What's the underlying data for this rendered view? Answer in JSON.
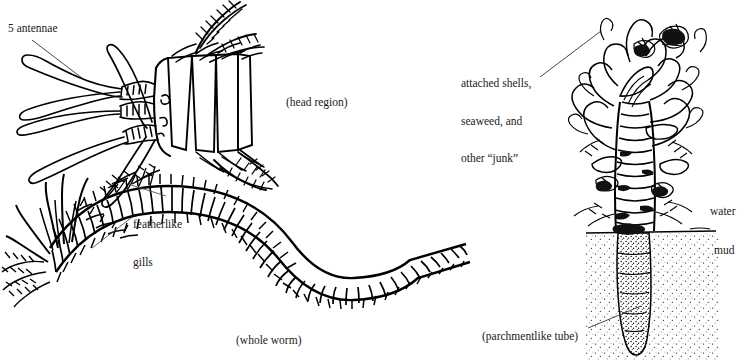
{
  "figure": {
    "background_color": "#ffffff",
    "ink_color": "#000000",
    "width": 744,
    "height": 360
  },
  "labels": {
    "antennae": "5 antennae",
    "gills_line1": "featherlike",
    "gills_line2": "gills",
    "junk_line1": "attached shells,",
    "junk_line2": "seaweed, and",
    "junk_line3": "other “junk”",
    "water": "water",
    "mud": "mud"
  },
  "captions": {
    "head_region": "(head region)",
    "whole_worm": "(whole worm)",
    "parchment_tube": "(parchmentlike tube)"
  },
  "icons": {
    "leader_antennae": "leader-line-icon",
    "leader_gills": "leader-line-icon",
    "leader_junk": "leader-line-icon",
    "leader_tube": "leader-line-icon",
    "mud_line": "waterline-icon"
  },
  "panels": [
    {
      "name": "head-region-detail",
      "caption": "(head region)"
    },
    {
      "name": "whole-worm-view",
      "caption": "(whole worm)"
    },
    {
      "name": "tube-habitat-view",
      "caption": "(parchmentlike tube)"
    }
  ]
}
